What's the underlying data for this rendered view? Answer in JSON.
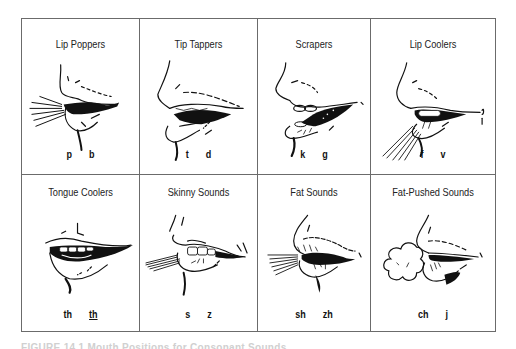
{
  "figure": {
    "panels": [
      {
        "title": "Lip Poppers",
        "sounds": [
          "p",
          "b"
        ],
        "underlined": [
          false,
          false
        ],
        "illustration": "lips-popping-air-burst"
      },
      {
        "title": "Tip Tappers",
        "sounds": [
          "t",
          "d"
        ],
        "underlined": [
          false,
          false
        ],
        "illustration": "tongue-tip-tapping"
      },
      {
        "title": "Scrapers",
        "sounds": [
          "k",
          "g"
        ],
        "underlined": [
          false,
          false
        ],
        "illustration": "back-tongue-scraping"
      },
      {
        "title": "Lip Coolers",
        "sounds": [
          "f",
          "v"
        ],
        "underlined": [
          false,
          false
        ],
        "illustration": "lip-teeth-air-downward"
      },
      {
        "title": "Tongue Coolers",
        "sounds": [
          "th",
          "th"
        ],
        "underlined": [
          false,
          true
        ],
        "illustration": "tongue-between-teeth"
      },
      {
        "title": "Skinny Sounds",
        "sounds": [
          "s",
          "z"
        ],
        "underlined": [
          false,
          false
        ],
        "illustration": "teeth-close-narrow-air"
      },
      {
        "title": "Fat Sounds",
        "sounds": [
          "sh",
          "zh"
        ],
        "underlined": [
          false,
          false
        ],
        "illustration": "rounded-lips-wide-air"
      },
      {
        "title": "Fat-Pushed Sounds",
        "sounds": [
          "ch",
          "j"
        ],
        "underlined": [
          false,
          false
        ],
        "illustration": "rounded-lips-air-puff"
      }
    ],
    "caption": "FIGURE 14.1  Mouth Positions for Consonant Sounds"
  },
  "colors": {
    "border": "#6b6b6b",
    "ink": "#111111",
    "caption": "#d0d0d0"
  }
}
